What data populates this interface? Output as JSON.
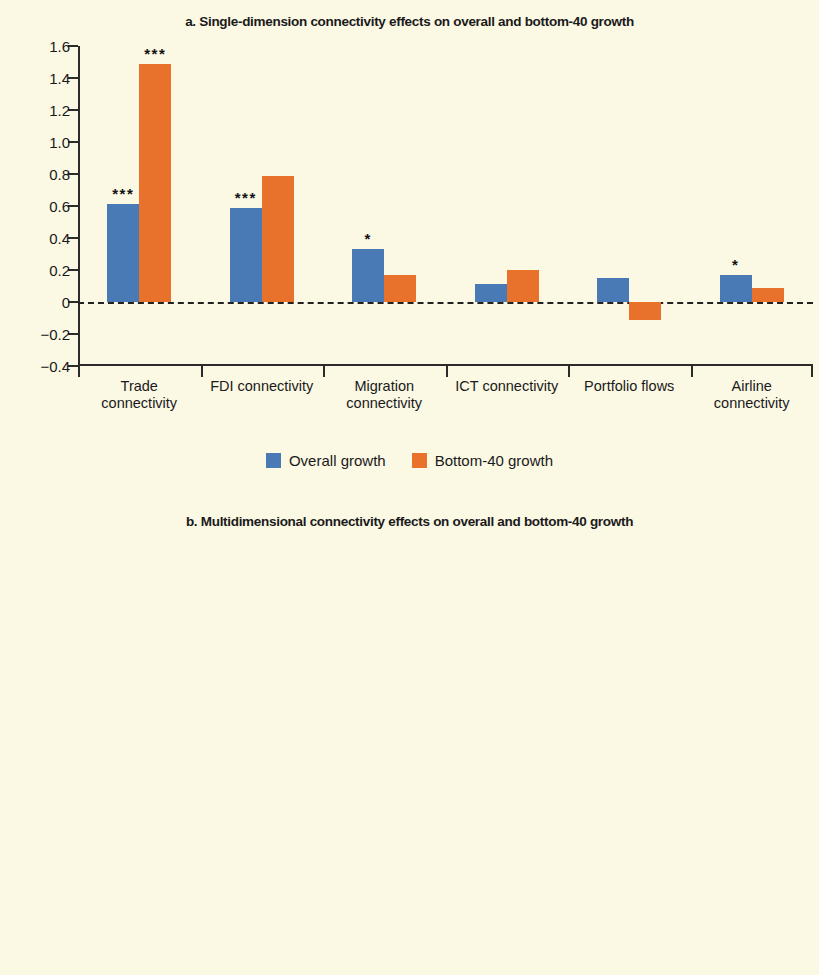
{
  "figure": {
    "background_color": "#fbf8e4",
    "series_colors": {
      "overall": "#4a7ab5",
      "bottom40": "#e8722c"
    }
  },
  "panel_a": {
    "title": "a. Single-dimension connectivity effects on overall and bottom-40 growth",
    "legend": [
      {
        "label": "Overall growth",
        "style": "solid-blue"
      },
      {
        "label": "Bottom-40 growth",
        "style": "solid-orange"
      }
    ]
  },
  "panel_b": {
    "title": "b. Multidimensional connectivity effects on overall and bottom-40 growth",
    "legend": [
      {
        "label": "Overall growth",
        "style": "hatch-blue"
      },
      {
        "label": "Bottom-40 growth",
        "style": "hatch-orange"
      }
    ]
  },
  "chart_data": [
    {
      "type": "bar",
      "id": "panel-a",
      "title": "a. Single-dimension connectivity effects on overall and bottom-40 growth",
      "xlabel": "",
      "ylabel": "",
      "ylim": [
        -0.4,
        1.6
      ],
      "ytick_labels": [
        "1.6",
        "1.4",
        "1.2",
        "1.0",
        "0.8",
        "0.6",
        "0.4",
        "0.2",
        "0",
        "-0.2",
        "-0.4"
      ],
      "ytick_values": [
        1.6,
        1.4,
        1.2,
        1.0,
        0.8,
        0.6,
        0.4,
        0.2,
        0,
        -0.2,
        -0.4
      ],
      "grid": false,
      "zero_line": true,
      "legend_position": "bottom",
      "categories": [
        "Trade\nconnectivity",
        "FDI connectivity",
        "Migration\nconnectivity",
        "ICT connectivity",
        "Portfolio flows",
        "Airline\nconnectivity"
      ],
      "category_lines": [
        [
          "Trade",
          "connectivity"
        ],
        [
          "FDI connectivity"
        ],
        [
          "Migration",
          "connectivity"
        ],
        [
          "ICT connectivity"
        ],
        [
          "Portfolio flows"
        ],
        [
          "Airline",
          "connectivity"
        ]
      ],
      "series": [
        {
          "name": "Overall growth",
          "color": "#4a7ab5",
          "values": [
            0.61,
            0.585,
            0.33,
            0.11,
            0.15,
            0.17
          ],
          "significance": [
            "***",
            "***",
            "*",
            "",
            "",
            "*"
          ]
        },
        {
          "name": "Bottom-40 growth",
          "color": "#e8722c",
          "values": [
            1.49,
            0.79,
            0.17,
            0.2,
            -0.11,
            0.09
          ],
          "significance": [
            "***",
            "",
            "",
            "",
            "",
            ""
          ]
        }
      ]
    },
    {
      "type": "bar",
      "id": "panel-b",
      "title": "b. Multidimensional connectivity effects on overall and bottom-40 growth",
      "xlabel": "",
      "ylabel": "",
      "ylim": [
        0,
        1.6
      ],
      "ytick_labels": [
        "1.6",
        "1.4",
        "1.2",
        "1.0",
        "0.8",
        "0.6",
        "0.4",
        "0.2",
        "0"
      ],
      "ytick_values": [
        1.6,
        1.4,
        1.2,
        1.0,
        0.8,
        0.6,
        0.4,
        0.2,
        0
      ],
      "grid": false,
      "zero_line": false,
      "legend_position": "bottom",
      "categories": [
        "Multidimensional connectivity"
      ],
      "category_lines": [
        [
          "Multidimensional connectivity"
        ]
      ],
      "series": [
        {
          "name": "Overall growth",
          "color": "#4a7ab5",
          "pattern": "horizontal-lines",
          "values": [
            0.66
          ],
          "significance": [
            "***"
          ]
        },
        {
          "name": "Bottom-40 growth",
          "color": "#e8722c",
          "pattern": "diagonal-lines",
          "values": [
            1.47
          ],
          "significance": [
            "***"
          ]
        }
      ]
    }
  ]
}
